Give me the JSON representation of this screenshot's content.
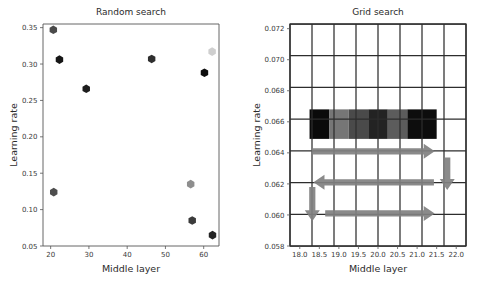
{
  "figure": {
    "width": 495,
    "height": 292,
    "background": "#ffffff"
  },
  "chart_data": [
    {
      "type": "scatter",
      "title": "Random search",
      "xlabel": "Middle layer",
      "ylabel": "Learning rate",
      "xlim": [
        18.0,
        64.0
      ],
      "ylim": [
        0.05,
        0.355
      ],
      "xticks": [
        "20",
        "30",
        "40",
        "50",
        "60"
      ],
      "xtick_values": [
        20,
        30,
        40,
        50,
        60
      ],
      "yticks": [
        "0.05",
        "0.10",
        "0.15",
        "0.20",
        "0.25",
        "0.30",
        "0.35"
      ],
      "ytick_values": [
        0.05,
        0.1,
        0.15,
        0.2,
        0.25,
        0.3,
        0.35
      ],
      "grid": false,
      "legend": "none",
      "marker": "hexagon",
      "points": [
        {
          "x": 20.7,
          "y": 0.347,
          "color": "#4a4a4a",
          "label": "p1"
        },
        {
          "x": 22.3,
          "y": 0.306,
          "color": "#161616",
          "label": "p2"
        },
        {
          "x": 29.3,
          "y": 0.266,
          "color": "#1d1d1d",
          "label": "p3"
        },
        {
          "x": 46.4,
          "y": 0.307,
          "color": "#2e2e2e",
          "label": "p4"
        },
        {
          "x": 60.2,
          "y": 0.288,
          "color": "#0d0d0d",
          "label": "p5"
        },
        {
          "x": 62.2,
          "y": 0.317,
          "color": "#cfcfcf",
          "label": "p6"
        },
        {
          "x": 20.8,
          "y": 0.124,
          "color": "#4d4d4d",
          "label": "p7"
        },
        {
          "x": 56.6,
          "y": 0.135,
          "color": "#8e8e8e",
          "label": "p8"
        },
        {
          "x": 57.0,
          "y": 0.085,
          "color": "#3b3b3b",
          "label": "p9"
        },
        {
          "x": 62.3,
          "y": 0.065,
          "color": "#242424",
          "label": "p10"
        }
      ]
    },
    {
      "type": "heatmap",
      "title": "Grid search",
      "xlabel": "Middle layer",
      "ylabel": "Learning rate",
      "xlim": [
        17.75,
        22.25
      ],
      "ylim": [
        0.058,
        0.0723
      ],
      "xticks": [
        "18.0",
        "18.5",
        "19.0",
        "19.5",
        "20.0",
        "20.5",
        "21.0",
        "21.5",
        "22.0"
      ],
      "xtick_values": [
        18.0,
        18.5,
        19.0,
        19.5,
        20.0,
        20.5,
        21.0,
        21.5,
        22.0
      ],
      "yticks": [
        "0.058",
        "0.060",
        "0.062",
        "0.064",
        "0.066",
        "0.068",
        "0.070",
        "0.072"
      ],
      "ytick_values": [
        0.058,
        0.06,
        0.062,
        0.064,
        0.066,
        0.068,
        0.07,
        0.072
      ],
      "grid": true,
      "grid_color": "#2d2d2d",
      "grid_cols": 8,
      "grid_rows": 7,
      "legend": "none",
      "cells": [
        {
          "x0": 18.25,
          "x1": 18.75,
          "y0": 0.0649,
          "y1": 0.0668,
          "color": "#0a0a0a",
          "label": "cell-1"
        },
        {
          "x0": 18.75,
          "x1": 19.25,
          "y0": 0.0649,
          "y1": 0.0668,
          "color": "#767676",
          "label": "cell-2"
        },
        {
          "x0": 19.25,
          "x1": 19.75,
          "y0": 0.0649,
          "y1": 0.0668,
          "color": "#4a4a4a",
          "label": "cell-3"
        },
        {
          "x0": 19.75,
          "x1": 20.25,
          "y0": 0.0649,
          "y1": 0.0668,
          "color": "#232323",
          "label": "cell-4"
        },
        {
          "x0": 20.25,
          "x1": 20.75,
          "y0": 0.0649,
          "y1": 0.0668,
          "color": "#5c5c5c",
          "label": "cell-5"
        },
        {
          "x0": 20.75,
          "x1": 21.5,
          "y0": 0.0649,
          "y1": 0.0668,
          "color": "#0d0d0d",
          "label": "cell-6"
        }
      ],
      "arrows": [
        {
          "name": "arrow-right-top",
          "direction": "right",
          "x_from": 18.3,
          "x_to": 21.45,
          "y": 0.0641,
          "color": "#808080"
        },
        {
          "name": "arrow-down-right",
          "direction": "down",
          "x": 21.77,
          "y_from": 0.0637,
          "y_to": 0.0616,
          "color": "#808080"
        },
        {
          "name": "arrow-left-middle",
          "direction": "left",
          "x_from": 21.43,
          "x_to": 18.35,
          "y": 0.0621,
          "color": "#808080"
        },
        {
          "name": "arrow-down-left",
          "direction": "down",
          "x": 18.32,
          "y_from": 0.0618,
          "y_to": 0.0596,
          "color": "#808080"
        },
        {
          "name": "arrow-right-bottom",
          "direction": "right",
          "x_from": 18.65,
          "x_to": 21.45,
          "y": 0.0601,
          "color": "#808080"
        }
      ]
    }
  ]
}
